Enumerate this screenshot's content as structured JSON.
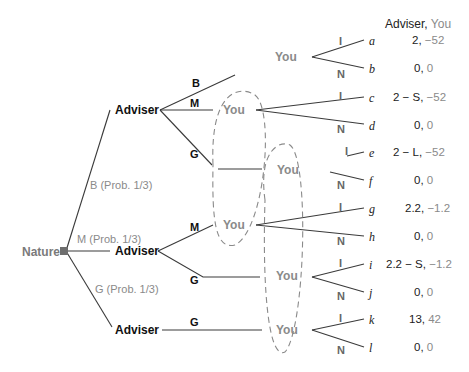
{
  "header": {
    "player1": "Adviser,",
    "player2": "You"
  },
  "nature": {
    "label": "Nature",
    "branches": [
      {
        "label": "B (Prob. 1/3)"
      },
      {
        "label": "M (Prob. 1/3)"
      },
      {
        "label": "G (Prob. 1/3)"
      }
    ]
  },
  "advisers": [
    {
      "label": "Adviser",
      "actions": [
        "B",
        "M",
        "G"
      ]
    },
    {
      "label": "Adviser",
      "actions": [
        "M",
        "G"
      ]
    },
    {
      "label": "Adviser",
      "actions": [
        "G"
      ]
    }
  ],
  "you_nodes": [
    "You",
    "You",
    "You",
    "You",
    "You",
    "You"
  ],
  "you_actions": {
    "invest": "I",
    "not": "N"
  },
  "terminals": [
    {
      "id": "a",
      "p1": "2,",
      "p2": "−52"
    },
    {
      "id": "b",
      "p1": "0,",
      "p2": "0"
    },
    {
      "id": "c",
      "p1": "2 − S,",
      "p2": "−52"
    },
    {
      "id": "d",
      "p1": "0,",
      "p2": "0"
    },
    {
      "id": "e",
      "p1": "2 − L,",
      "p2": "−52"
    },
    {
      "id": "f",
      "p1": "0,",
      "p2": "0"
    },
    {
      "id": "g",
      "p1": "2.2,",
      "p2": "−1.2"
    },
    {
      "id": "h",
      "p1": "0,",
      "p2": "0"
    },
    {
      "id": "i",
      "p1": "2.2 − S,",
      "p2": "−1.2"
    },
    {
      "id": "j",
      "p1": "0,",
      "p2": "0"
    },
    {
      "id": "k",
      "p1": "13,",
      "p2": "42"
    },
    {
      "id": "l",
      "p1": "0,",
      "p2": "0"
    }
  ],
  "colors": {
    "line": "#3a3a3a",
    "gray_text": "#8a8a8a",
    "nature_node": "#6e6e6e"
  }
}
